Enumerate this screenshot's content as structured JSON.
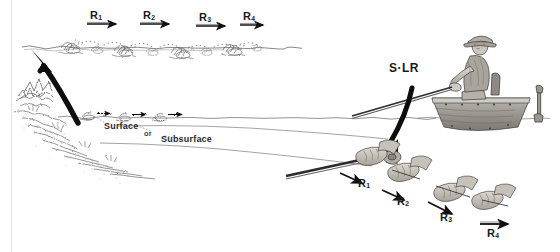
{
  "figure": {
    "background_color": "#ffffff",
    "ink_color": "#1a1a1a",
    "style": "pencil line drawing"
  },
  "surface_retrieve": {
    "description": "Lure skipping along the water surface, left to right",
    "steps": [
      {
        "id": "R1",
        "letter": "R",
        "sub": "1"
      },
      {
        "id": "R2",
        "letter": "R",
        "sub": "2"
      },
      {
        "id": "R3",
        "letter": "R",
        "sub": "3"
      },
      {
        "id": "R4",
        "letter": "R",
        "sub": "4"
      }
    ]
  },
  "hand_retrieve": {
    "description": "Close-up of hands working the rod, stepped downward to the right",
    "steps": [
      {
        "id": "R1",
        "letter": "R",
        "sub": "1"
      },
      {
        "id": "R2",
        "letter": "R",
        "sub": "2"
      },
      {
        "id": "R3",
        "letter": "R",
        "sub": "3"
      },
      {
        "id": "R4",
        "letter": "R",
        "sub": "4"
      }
    ]
  },
  "path_labels": {
    "surface": "Surface",
    "conjunction": "or",
    "subsurface": "Subsurface"
  },
  "rod_label": {
    "text": "S·LR"
  },
  "angler": {
    "description": "Seated angler in a small boat casting toward the left"
  },
  "structure": {
    "description": "Submerged rocky weed edge at lower left"
  }
}
